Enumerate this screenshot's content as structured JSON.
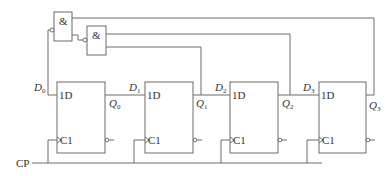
{
  "diagram": {
    "type": "shift-register-counter",
    "gates": [
      {
        "id": "and1",
        "symbol": "&"
      },
      {
        "id": "and2",
        "symbol": "&"
      }
    ],
    "flip_flops": [
      {
        "d_pin": "1D",
        "clk_pin": "C1",
        "input_label": "D",
        "input_sub": "0",
        "output_label": "Q",
        "output_sub": "0"
      },
      {
        "d_pin": "1D",
        "clk_pin": "C1",
        "input_label": "D",
        "input_sub": "1",
        "output_label": "Q",
        "output_sub": "1"
      },
      {
        "d_pin": "1D",
        "clk_pin": "C1",
        "input_label": "D",
        "input_sub": "2",
        "output_label": "Q",
        "output_sub": "2"
      },
      {
        "d_pin": "1D",
        "clk_pin": "C1",
        "input_label": "D",
        "input_sub": "3",
        "output_label": "Q",
        "output_sub": "3"
      }
    ],
    "clock_label": "CP"
  }
}
